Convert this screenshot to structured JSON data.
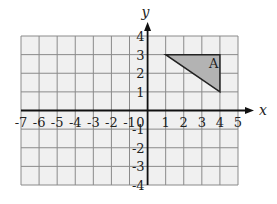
{
  "diagram": {
    "type": "coordinate-grid",
    "x_axis_label": "x",
    "y_axis_label": "y",
    "x_range": [
      -7,
      5
    ],
    "y_range": [
      -4,
      4
    ],
    "x_ticks": [
      "-7",
      "-6",
      "-5",
      "-4",
      "-3",
      "-2",
      "-1",
      "1",
      "2",
      "3",
      "4",
      "5"
    ],
    "y_ticks": [
      "4",
      "3",
      "2",
      "1",
      "-1",
      "-2",
      "-3",
      "-4"
    ],
    "origin_label": "0",
    "shape": {
      "label": "A",
      "vertices": [
        [
          1,
          3
        ],
        [
          4,
          3
        ],
        [
          4,
          1
        ]
      ],
      "fill": "#b3b3b3",
      "stroke": "#222222"
    },
    "colors": {
      "grid_bg": "#f0f0f0",
      "grid_line": "#8a8a8a",
      "axis": "#111111"
    }
  }
}
